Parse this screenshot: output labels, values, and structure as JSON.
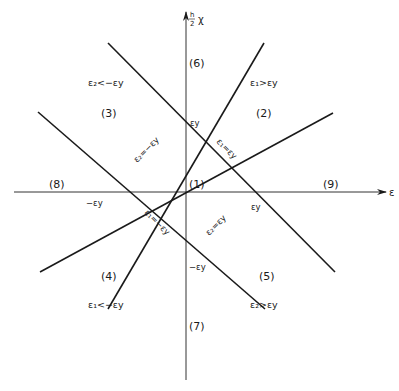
{
  "colors": {
    "background": "#ffffff",
    "ink": "#1a1a1a",
    "axis": "#333333"
  },
  "axes": {
    "horizontal_label": "ε",
    "vertical_label_fraction_top": "h",
    "vertical_label_fraction_bottom": "2",
    "vertical_label_symbol": "χ"
  },
  "regions": {
    "r1": "(1)",
    "r2": "(2)",
    "r3": "(3)",
    "r4": "(4)",
    "r5": "(5)",
    "r6": "(6)",
    "r7": "(7)",
    "r8": "(8)",
    "r9": "(9)"
  },
  "conditions": {
    "top_left": "ε₂<−εy",
    "top_right": "ε₁>εy",
    "bottom_left": "ε₁<−εy",
    "bottom_right": "ε₂>εy"
  },
  "line_labels": {
    "upper_left": "ε₂=−εy",
    "upper_right": "ε₁=εy",
    "lower_left": "ε₁=−εy",
    "lower_right": "ε₂=εy"
  },
  "intercepts": {
    "top": "εy",
    "right": "εy",
    "left": "−εy",
    "bottom": "−εy"
  }
}
